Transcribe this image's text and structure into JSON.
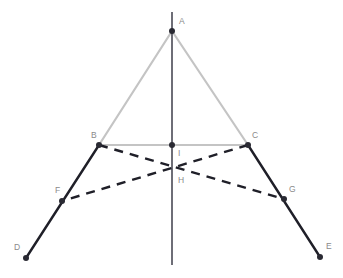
{
  "figure": {
    "background_color": "#ffffff",
    "width": 343,
    "height": 278
  },
  "styles": {
    "light_edge_color": "#c4c4c4",
    "dark_edge_color": "#1f1f28",
    "axis_color": "#4a4a55",
    "dashed_color": "#1f1f28",
    "label_color": "#8a8a8a",
    "point_fill": "#2a2a33",
    "dash_pattern": "9 7",
    "light_edge_width": 2.2,
    "dark_edge_width": 2.4,
    "axis_width": 1.6,
    "dashed_width": 2.4
  },
  "points": [
    {
      "id": "A",
      "label": "A",
      "x": 172,
      "y": 31,
      "label_x": 179,
      "label_y": 22,
      "marker": "dot"
    },
    {
      "id": "B",
      "label": "B",
      "x": 99,
      "y": 145,
      "label_x": 91,
      "label_y": 136,
      "marker": "dot"
    },
    {
      "id": "C",
      "label": "C",
      "x": 248,
      "y": 145,
      "label_x": 252,
      "label_y": 136,
      "marker": "dot"
    },
    {
      "id": "D",
      "label": "D",
      "x": 26,
      "y": 258,
      "label_x": 14,
      "label_y": 248,
      "marker": "dot"
    },
    {
      "id": "E",
      "label": "E",
      "x": 320,
      "y": 257,
      "label_x": 326,
      "label_y": 247,
      "marker": "dot"
    },
    {
      "id": "F",
      "label": "F",
      "x": 62,
      "y": 201,
      "label_x": 55,
      "label_y": 191,
      "marker": "dot"
    },
    {
      "id": "G",
      "label": "G",
      "x": 284,
      "y": 199,
      "label_x": 289,
      "label_y": 190,
      "marker": "dot"
    },
    {
      "id": "H",
      "label": "H",
      "x": 172,
      "y": 167,
      "label_x": 178,
      "label_y": 181,
      "marker": "none"
    },
    {
      "id": "I",
      "label": "I",
      "x": 172,
      "y": 145,
      "label_x": 178,
      "label_y": 154,
      "marker": "dot"
    }
  ],
  "segments": [
    {
      "id": "AB",
      "from": "A",
      "to": "B",
      "style": "light",
      "name": "segment-ab"
    },
    {
      "id": "AC",
      "from": "A",
      "to": "C",
      "style": "light",
      "name": "segment-ac"
    },
    {
      "id": "BC",
      "from": "B",
      "to": "C",
      "style": "light",
      "name": "segment-bc"
    },
    {
      "id": "BD",
      "from": "B",
      "to": "D",
      "style": "dark",
      "name": "segment-bd"
    },
    {
      "id": "CE",
      "from": "C",
      "to": "E",
      "style": "dark",
      "name": "segment-ce"
    },
    {
      "id": "BG",
      "from": "B",
      "to": "G",
      "style": "dashed",
      "name": "segment-bg"
    },
    {
      "id": "CF",
      "from": "C",
      "to": "F",
      "style": "dashed",
      "name": "segment-cf"
    }
  ],
  "axis": {
    "id": "vertical-axis",
    "x": 172,
    "y_top": 12,
    "y_bottom": 265,
    "style": "axis"
  }
}
